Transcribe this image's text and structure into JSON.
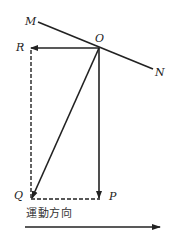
{
  "diagram": {
    "labels": {
      "M": "M",
      "N": "N",
      "O": "O",
      "R": "R",
      "Q": "Q",
      "P": "P"
    },
    "caption": "運動方向",
    "colors": {
      "line": "#222222",
      "background": "#ffffff"
    },
    "elements": [
      {
        "id": "line-MN",
        "type": "solid-line",
        "from": "M",
        "to": "N"
      },
      {
        "id": "arrow-OR",
        "type": "solid-arrow",
        "from": "O",
        "to": "R"
      },
      {
        "id": "arrow-OQ",
        "type": "solid-arrow",
        "from": "O",
        "to": "Q"
      },
      {
        "id": "arrow-OP",
        "type": "solid-arrow",
        "from": "O",
        "to": "P"
      },
      {
        "id": "dashed-RQ",
        "type": "dashed-line",
        "from": "R",
        "to": "Q"
      },
      {
        "id": "dashed-QP",
        "type": "dashed-line",
        "from": "Q",
        "to": "P"
      },
      {
        "id": "motion-arrow",
        "type": "solid-arrow",
        "direction": "right",
        "label": "運動方向"
      }
    ]
  }
}
